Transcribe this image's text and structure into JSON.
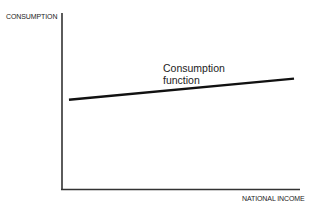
{
  "chart_data": {
    "type": "line",
    "title": "",
    "xlabel": "NATIONAL INCOME",
    "ylabel": "CONSUMPTION",
    "grid": false,
    "legend": null,
    "series": [
      {
        "name": "Consumption function",
        "x": [
          0.03,
          1.0
        ],
        "y": [
          0.51,
          0.63
        ]
      }
    ],
    "annotations": [
      {
        "text": "Consumption function",
        "line1": "Consumption",
        "line2": "function"
      }
    ],
    "xlim": [
      0,
      1
    ],
    "ylim": [
      0,
      1
    ]
  }
}
